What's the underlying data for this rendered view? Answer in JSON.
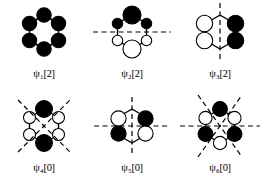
{
  "figure": {
    "colors": {
      "lobe_positive_fill": "#000000",
      "lobe_negative_fill": "#ffffff",
      "stroke": "#000000",
      "node_line": "#000000",
      "background": "#ffffff"
    },
    "panels": [
      {
        "id": "psi1",
        "label_psi": "ψ",
        "label_index": "1",
        "label_occupancy": "[2]",
        "label_full": "ψ1[2]",
        "nodes": 0,
        "node_lines": [],
        "lobes": [
          {
            "position": "top",
            "sign": "filled",
            "size": "medium"
          },
          {
            "position": "upper-right",
            "sign": "filled",
            "size": "medium"
          },
          {
            "position": "lower-right",
            "sign": "filled",
            "size": "medium"
          },
          {
            "position": "bottom",
            "sign": "filled",
            "size": "medium"
          },
          {
            "position": "lower-left",
            "sign": "filled",
            "size": "medium"
          },
          {
            "position": "upper-left",
            "sign": "filled",
            "size": "medium"
          }
        ]
      },
      {
        "id": "psi2",
        "label_psi": "ψ",
        "label_index": "2",
        "label_occupancy": "[2]",
        "label_full": "ψ2[2]",
        "nodes": 1,
        "node_lines": [
          "horizontal"
        ],
        "lobes": [
          {
            "position": "top",
            "sign": "filled",
            "size": "large"
          },
          {
            "position": "upper-right",
            "sign": "filled",
            "size": "small"
          },
          {
            "position": "lower-right",
            "sign": "open",
            "size": "small"
          },
          {
            "position": "bottom",
            "sign": "open",
            "size": "large"
          },
          {
            "position": "lower-left",
            "sign": "open",
            "size": "small"
          },
          {
            "position": "upper-left",
            "sign": "filled",
            "size": "small"
          }
        ]
      },
      {
        "id": "psi3",
        "label_psi": "ψ",
        "label_index": "3",
        "label_occupancy": "[2]",
        "label_full": "ψ3[2]",
        "nodes": 1,
        "node_lines": [
          "vertical"
        ],
        "lobes": [
          {
            "position": "upper-right",
            "sign": "filled",
            "size": "medium"
          },
          {
            "position": "lower-right",
            "sign": "filled",
            "size": "medium"
          },
          {
            "position": "lower-left",
            "sign": "open",
            "size": "medium"
          },
          {
            "position": "upper-left",
            "sign": "open",
            "size": "medium"
          }
        ]
      },
      {
        "id": "psi4",
        "label_psi": "ψ",
        "label_index": "4",
        "label_occupancy": "[0]",
        "label_full": "ψ4[0]",
        "nodes": 2,
        "node_lines": [
          "diagonal-down",
          "diagonal-up"
        ],
        "lobes": [
          {
            "position": "top",
            "sign": "filled",
            "size": "large"
          },
          {
            "position": "upper-right",
            "sign": "open",
            "size": "small"
          },
          {
            "position": "lower-right",
            "sign": "open",
            "size": "small"
          },
          {
            "position": "bottom",
            "sign": "filled",
            "size": "large"
          },
          {
            "position": "lower-left",
            "sign": "open",
            "size": "small"
          },
          {
            "position": "upper-left",
            "sign": "open",
            "size": "small"
          }
        ]
      },
      {
        "id": "psi5",
        "label_psi": "ψ",
        "label_index": "5",
        "label_occupancy": "[0]",
        "label_full": "ψ5[0]",
        "nodes": 2,
        "node_lines": [
          "vertical",
          "horizontal"
        ],
        "lobes": [
          {
            "position": "upper-right",
            "sign": "filled",
            "size": "medium"
          },
          {
            "position": "lower-right",
            "sign": "open",
            "size": "medium"
          },
          {
            "position": "lower-left",
            "sign": "filled",
            "size": "medium"
          },
          {
            "position": "upper-left",
            "sign": "open",
            "size": "medium"
          }
        ]
      },
      {
        "id": "psi6",
        "label_psi": "ψ",
        "label_index": "6",
        "label_occupancy": "[0]",
        "label_full": "ψ6[0]",
        "nodes": 3,
        "node_lines": [
          "horizontal",
          "diagonal-down",
          "diagonal-up"
        ],
        "lobes": [
          {
            "position": "top",
            "sign": "filled",
            "size": "medium"
          },
          {
            "position": "upper-right",
            "sign": "open",
            "size": "medium"
          },
          {
            "position": "lower-right",
            "sign": "filled",
            "size": "medium"
          },
          {
            "position": "bottom",
            "sign": "open",
            "size": "medium"
          },
          {
            "position": "lower-left",
            "sign": "filled",
            "size": "medium"
          },
          {
            "position": "upper-left",
            "sign": "open",
            "size": "medium"
          }
        ]
      }
    ]
  }
}
